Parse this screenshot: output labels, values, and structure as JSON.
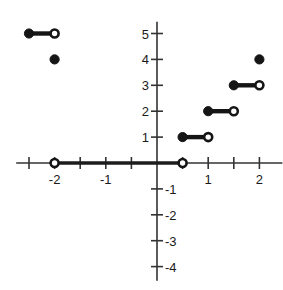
{
  "chart_data": {
    "type": "line",
    "title": "",
    "subtitle": "",
    "xlabel": "",
    "ylabel": "",
    "xlim": [
      -2.75,
      2.45
    ],
    "ylim": [
      -4.55,
      5.45
    ],
    "grid": false,
    "legend": null,
    "annotations": [],
    "x_ticks": [
      {
        "value": -2.5,
        "label": ""
      },
      {
        "value": -2,
        "label": "-2"
      },
      {
        "value": -1.5,
        "label": ""
      },
      {
        "value": -1,
        "label": "-1"
      },
      {
        "value": -0.5,
        "label": ""
      },
      {
        "value": 0.5,
        "label": ""
      },
      {
        "value": 1,
        "label": "1"
      },
      {
        "value": 1.5,
        "label": ""
      },
      {
        "value": 2,
        "label": "2"
      }
    ],
    "y_ticks": [
      {
        "value": 5,
        "label": "5"
      },
      {
        "value": 4,
        "label": "4"
      },
      {
        "value": 3,
        "label": "3"
      },
      {
        "value": 2,
        "label": "2"
      },
      {
        "value": 1,
        "label": "1"
      },
      {
        "value": -1,
        "label": "-1"
      },
      {
        "value": -2,
        "label": "-2"
      },
      {
        "value": -3,
        "label": "-3"
      },
      {
        "value": -4,
        "label": "-4"
      }
    ],
    "segments": [
      {
        "id": "seg-y5",
        "x0": -2.5,
        "x1": -2.0,
        "y": 5,
        "left_endpoint": "closed",
        "right_endpoint": "open"
      },
      {
        "id": "seg-y0",
        "x0": -2.0,
        "x1": 0.5,
        "y": 0,
        "left_endpoint": "open",
        "right_endpoint": "open"
      },
      {
        "id": "seg-y1",
        "x0": 0.5,
        "x1": 1.0,
        "y": 1,
        "left_endpoint": "closed",
        "right_endpoint": "open"
      },
      {
        "id": "seg-y2",
        "x0": 1.0,
        "x1": 1.5,
        "y": 2,
        "left_endpoint": "closed",
        "right_endpoint": "open"
      },
      {
        "id": "seg-y3",
        "x0": 1.5,
        "x1": 2.0,
        "y": 3,
        "left_endpoint": "closed",
        "right_endpoint": "open"
      }
    ],
    "isolated_points": [
      {
        "id": "pt-neg2-4",
        "x": -2,
        "y": 4,
        "style": "closed"
      },
      {
        "id": "pt-2-4",
        "x": 2,
        "y": 4,
        "style": "closed"
      }
    ]
  },
  "axes": {
    "x_axis_name": "x-axis",
    "y_axis_name": "y-axis",
    "origin_label": ""
  }
}
